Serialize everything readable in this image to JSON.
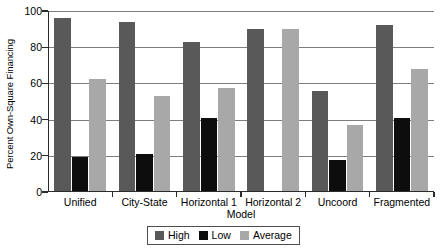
{
  "chart_data": {
    "type": "bar",
    "title": "",
    "xlabel": "Model",
    "ylabel": "Percent Own-Square Financing",
    "categories": [
      "Unified",
      "City-State",
      "Horizontal 1",
      "Horizontal 2",
      "Uncoord",
      "Fragmented"
    ],
    "series": [
      {
        "name": "High",
        "color": "#595959",
        "values": [
          96,
          94,
          83,
          90,
          56,
          92
        ]
      },
      {
        "name": "Low",
        "color": "#0d0d0d",
        "values": [
          19.5,
          21,
          41,
          0,
          17.5,
          41
        ]
      },
      {
        "name": "Average",
        "color": "#a8a8a8",
        "values": [
          62.5,
          53,
          57.5,
          90,
          37,
          68
        ]
      }
    ],
    "ylim": [
      0,
      100
    ],
    "yticks": [
      0,
      20,
      40,
      60,
      80,
      100
    ],
    "ytick_labels": [
      "0",
      "20",
      "40",
      "60",
      "80",
      "100"
    ],
    "grid": true,
    "grid_axis": "y",
    "legend_position": "bottom-center",
    "legend_entries": [
      "High",
      "Low",
      "Average"
    ]
  }
}
